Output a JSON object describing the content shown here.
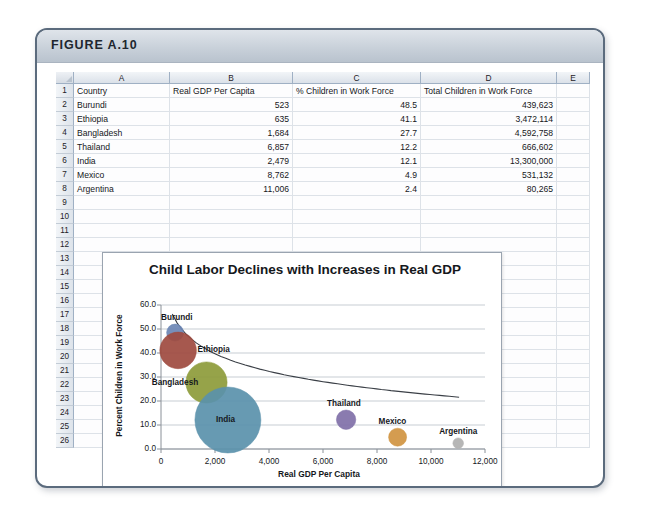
{
  "figure": {
    "label": "FIGURE A.10"
  },
  "spreadsheet": {
    "column_headers": [
      "A",
      "B",
      "C",
      "D",
      "E"
    ],
    "row_numbers": [
      "1",
      "2",
      "3",
      "4",
      "5",
      "6",
      "7",
      "8",
      "9",
      "10",
      "11",
      "12",
      "13",
      "14",
      "15",
      "16",
      "17",
      "18",
      "19",
      "20",
      "21",
      "22",
      "23",
      "24",
      "25",
      "26"
    ],
    "header_row": {
      "a": "Country",
      "b": "Real GDP Per Capita",
      "c": "% Children in Work Force",
      "d": "Total Children in Work Force"
    },
    "rows": [
      {
        "row": "2",
        "country": "Burundi",
        "gdp": "523",
        "pct": "48.5",
        "total": "439,623"
      },
      {
        "row": "3",
        "country": "Ethiopia",
        "gdp": "635",
        "pct": "41.1",
        "total": "3,472,114"
      },
      {
        "row": "4",
        "country": "Bangladesh",
        "gdp": "1,684",
        "pct": "27.7",
        "total": "4,592,758"
      },
      {
        "row": "5",
        "country": "Thailand",
        "gdp": "6,857",
        "pct": "12.2",
        "total": "666,602"
      },
      {
        "row": "6",
        "country": "India",
        "gdp": "2,479",
        "pct": "12.1",
        "total": "13,300,000"
      },
      {
        "row": "7",
        "country": "Mexico",
        "gdp": "8,762",
        "pct": "4.9",
        "total": "531,132"
      },
      {
        "row": "8",
        "country": "Argentina",
        "gdp": "11,006",
        "pct": "2.4",
        "total": "80,265"
      }
    ]
  },
  "chart_data": {
    "type": "scatter",
    "title": "Child Labor Declines with Increases in Real GDP",
    "xlabel": "Real GDP Per Capita",
    "ylabel": "Percent Children in Work Force",
    "xlim": [
      0,
      12000
    ],
    "ylim": [
      0,
      60
    ],
    "xticks": [
      "0",
      "2,000",
      "4,000",
      "6,000",
      "8,000",
      "10,000",
      "12,000"
    ],
    "yticks": [
      "0.0",
      "10.0",
      "20.0",
      "30.0",
      "40.0",
      "50.0",
      "60.0"
    ],
    "grid": "horizontal",
    "legend": "none",
    "bubble_size_field": "Total Children in Work Force",
    "trendline": "logarithmic decreasing",
    "points": [
      {
        "label": "Burundi",
        "x": 523,
        "y": 48.5,
        "size": 439623,
        "color": "#6b86b4",
        "label_pos": "above-left"
      },
      {
        "label": "Ethiopia",
        "x": 635,
        "y": 41.1,
        "size": 3472114,
        "color": "#9e4a3f",
        "label_pos": "right"
      },
      {
        "label": "Bangladesh",
        "x": 1684,
        "y": 27.7,
        "size": 4592758,
        "color": "#8d9b3a",
        "label_pos": "left"
      },
      {
        "label": "India",
        "x": 2479,
        "y": 12.1,
        "size": 13300000,
        "color": "#5a91ab",
        "label_pos": "center"
      },
      {
        "label": "Thailand",
        "x": 6857,
        "y": 12.2,
        "size": 666602,
        "color": "#8070a8",
        "label_pos": "above"
      },
      {
        "label": "Mexico",
        "x": 8762,
        "y": 4.9,
        "size": 531132,
        "color": "#d09441",
        "label_pos": "above"
      },
      {
        "label": "Argentina",
        "x": 11006,
        "y": 2.4,
        "size": 80265,
        "color": "#b0b0b0",
        "label_pos": "above"
      }
    ]
  }
}
